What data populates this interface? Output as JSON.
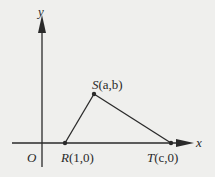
{
  "diagram": {
    "type": "coordinate-geometry",
    "axes": {
      "x_label": "x",
      "y_label": "y",
      "origin_label": "O"
    },
    "points": [
      {
        "id": "R",
        "label": "R",
        "coords": "(1,0)"
      },
      {
        "id": "S",
        "label": "S",
        "coords": "(a,b)"
      },
      {
        "id": "T",
        "label": "T",
        "coords": "(c,0)"
      }
    ],
    "segments": [
      [
        "R",
        "S"
      ],
      [
        "S",
        "T"
      ]
    ],
    "colors": {
      "ink": "#2a2a2a",
      "background": "#efefed"
    }
  }
}
